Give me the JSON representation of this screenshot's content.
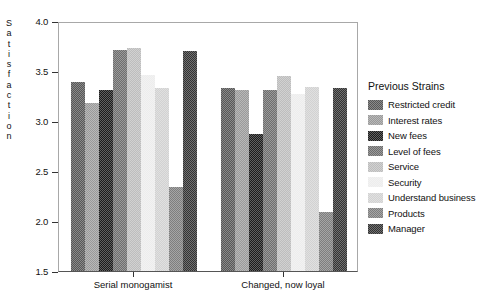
{
  "chart_data": {
    "type": "bar",
    "title": "",
    "xlabel": "",
    "ylabel": "Satisfaction",
    "ylim": [
      1.5,
      4.0
    ],
    "yticks": [
      "4.0",
      "3.5",
      "3.0",
      "2.5",
      "2.0",
      "1.5"
    ],
    "ytick_values": [
      4.0,
      3.5,
      3.0,
      2.5,
      2.0,
      1.5
    ],
    "grid": false,
    "legend_position": "right",
    "legend_title": "Previous Strains",
    "categories": [
      "Serial monogamist",
      "Changed, now loyal"
    ],
    "series": [
      {
        "name": "Restricted credit",
        "values": [
          3.39,
          3.33
        ],
        "color": "#585858"
      },
      {
        "name": "Interest rates",
        "values": [
          3.18,
          3.31
        ],
        "color": "#9a9a9a"
      },
      {
        "name": "New fees",
        "values": [
          3.31,
          2.87
        ],
        "color": "#1c1c1c"
      },
      {
        "name": "Level of fees",
        "values": [
          3.71,
          3.31
        ],
        "color": "#6e6e6e"
      },
      {
        "name": "Service",
        "values": [
          3.73,
          3.45
        ],
        "color": "#bdbdbd"
      },
      {
        "name": "Security",
        "values": [
          3.46,
          3.27
        ],
        "color": "#ededed"
      },
      {
        "name": "Understand business",
        "values": [
          3.33,
          3.34
        ],
        "color": "#d2d2d2"
      },
      {
        "name": "Products",
        "values": [
          2.34,
          2.09
        ],
        "color": "#7e7e7e"
      },
      {
        "name": "Manager",
        "values": [
          3.7,
          3.33
        ],
        "color": "#333333"
      }
    ]
  },
  "axis": {
    "y_title_letters": [
      "S",
      "a",
      "t",
      "i",
      "s",
      "f",
      "a",
      "c",
      "t",
      "i",
      "o",
      "n"
    ]
  }
}
